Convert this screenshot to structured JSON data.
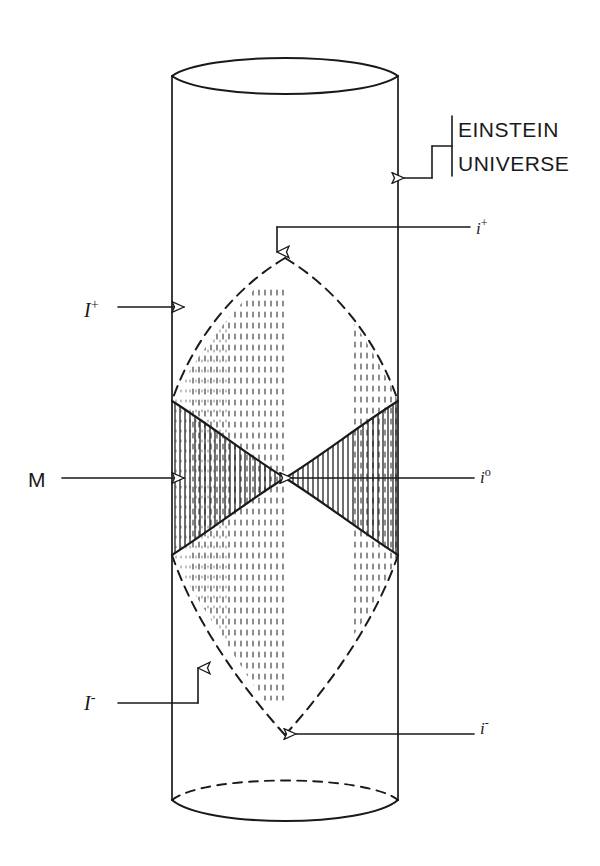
{
  "figure": {
    "stroke_color": "#1a1a1a",
    "background_color": "#ffffff"
  },
  "labels": {
    "einstein_line1": "EINSTEIN",
    "einstein_line2": "UNIVERSE",
    "i_plus": "i",
    "i_plus_sup": "+",
    "i_zero": "i",
    "i_zero_sup": "o",
    "i_minus": "i",
    "i_minus_sup": "-",
    "scri_plus": "I",
    "scri_plus_sup": "+",
    "scri_minus": "I",
    "scri_minus_sup": "-",
    "manifold": "M"
  },
  "icons": {
    "arrow_einstein": "arrow-left-icon",
    "arrow_i_plus": "arrow-down-icon",
    "arrow_i_zero": "arrow-left-icon",
    "arrow_i_minus": "arrow-left-icon",
    "arrow_scri_plus": "arrow-right-icon",
    "arrow_scri_minus": "arrow-up-icon",
    "arrow_manifold": "arrow-right-icon"
  },
  "geometry": {
    "cylinder_left_x": 172,
    "cylinder_right_x": 398,
    "cylinder_top_y": 76,
    "cylinder_bottom_y": 800,
    "ellipse_rise": 22,
    "center_x": 285,
    "crossing_y": 478,
    "i_plus_point_y": 258,
    "i_minus_point_y": 735
  }
}
